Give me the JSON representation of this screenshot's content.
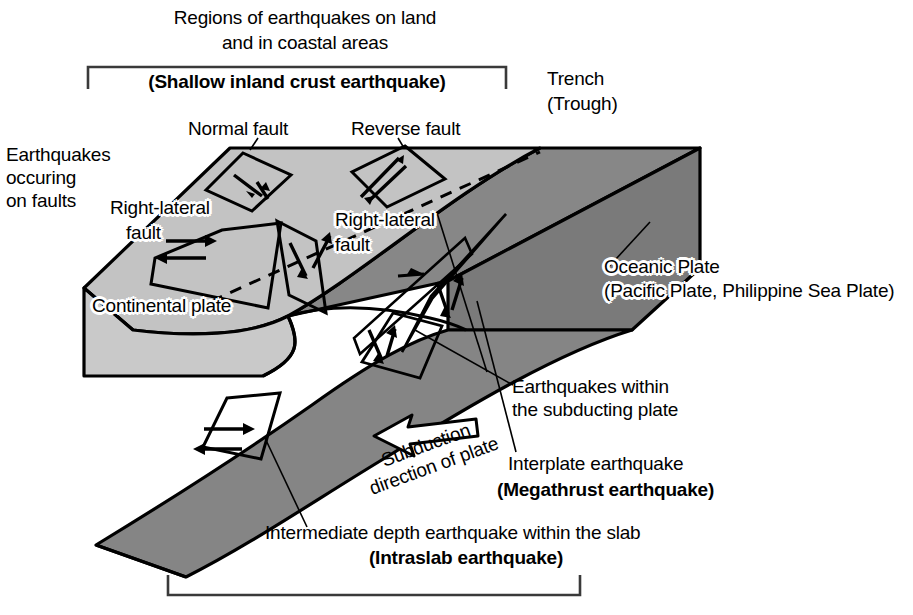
{
  "figure": {
    "type": "geological-cross-section-block-diagram"
  },
  "colors": {
    "continental_plate_fill": "#c3c3c3",
    "continental_plate_side_fill": "#c9c9c9",
    "oceanic_plate_fill": "#878787",
    "oceanic_plate_side_fill": "#7a7a7a",
    "slab_fill": "#858585",
    "outline": "#000000",
    "background": "#ffffff",
    "bracket": "#3a3a3a"
  },
  "brackets": {
    "top": {
      "name": "shallow-inland-crust-bracket",
      "x1": 88,
      "x2": 506,
      "y": 67,
      "tick": 22,
      "direction": "up"
    },
    "bottom": {
      "name": "subduction-zone-bracket",
      "x1": 168,
      "x2": 580,
      "y": 595,
      "tick": 20,
      "direction": "down"
    }
  },
  "labels": {
    "top_heading_line1": "Regions of earthquakes on land",
    "top_heading_line2": "and in coastal areas",
    "shallow_inland": "(Shallow inland crust earthquake)",
    "trench_line1": "Trench",
    "trench_line2": "(Trough)",
    "earthquakes_on_faults_line1": "Earthquakes",
    "earthquakes_on_faults_line2": "occuring",
    "earthquakes_on_faults_line3": "on faults",
    "normal_fault": "Normal fault",
    "reverse_fault": "Reverse fault",
    "right_lateral_left_line1": "Right-lateral",
    "right_lateral_left_line2": "fault",
    "right_lateral_right_line1": "Right-lateral",
    "right_lateral_right_line2": "fault",
    "continental_plate": "Continental plate",
    "oceanic_plate_line1": "Oceanic Plate",
    "oceanic_plate_line2": "(Pacific Plate, Philippine Sea Plate)",
    "subduction_arrow_line1": "Subduction",
    "subduction_arrow_line2": "direction of plate",
    "within_subducting_line1": "Earthquakes within",
    "within_subducting_line2": "the subducting plate",
    "interplate_line1": "Interplate earthquake",
    "interplate_line2": "(Megathrust earthquake)",
    "intraslab_line1": "Intermediate depth earthquake within the slab",
    "intraslab_line2": "(Intraslab earthquake)"
  },
  "icons": {
    "subduction_arrow": "hollow-left-arrow-icon",
    "fault_plane": "fault-plane-parallelogram-icon",
    "slip_arrows": "slip-direction-arrow-icon",
    "leader_line": "leader-line-icon",
    "dashed_plate_boundary": "dashed-plate-boundary-icon"
  },
  "features": [
    {
      "name": "normal-fault-plane",
      "label_key": "normal_fault"
    },
    {
      "name": "reverse-fault-plane",
      "label_key": "reverse_fault"
    },
    {
      "name": "right-lateral-fault-plane-left",
      "label_key": "right_lateral_left_line1"
    },
    {
      "name": "right-lateral-fault-plane-right",
      "label_key": "right_lateral_right_line1"
    },
    {
      "name": "interplate-megathrust-fault-plane",
      "label_key": "interplate_line1"
    },
    {
      "name": "intraslab-fault-plane",
      "label_key": "intraslab_line1"
    },
    {
      "name": "within-subducting-plate-fault-plane",
      "label_key": "within_subducting_line1"
    }
  ]
}
